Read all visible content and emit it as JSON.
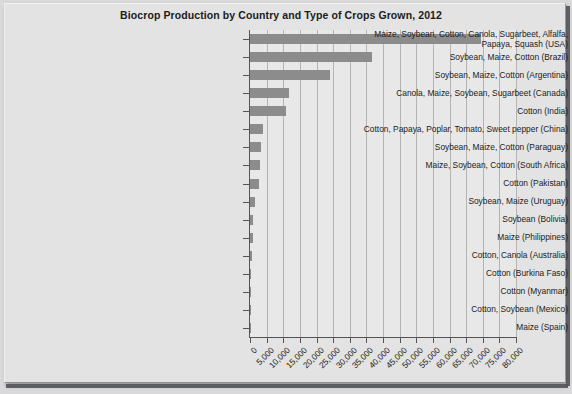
{
  "chart_data": {
    "type": "bar",
    "orientation": "horizontal",
    "title": "Biocrop Production by Country and Type of Crops Grown, 2012",
    "xlabel": "",
    "ylabel": "",
    "xlim": [
      0,
      80000
    ],
    "xticks": [
      "0",
      "5,000",
      "10,000",
      "15,000",
      "20,000",
      "25,000",
      "30,000",
      "35,000",
      "40,000",
      "45,000",
      "50,000",
      "55,000",
      "60,000",
      "65,000",
      "70,000",
      "75,000",
      "80,000"
    ],
    "grid": true,
    "legend": "none",
    "bar_color": "#8c8c8c",
    "plot_background": "#e8e8e8",
    "panel_background": "#e3e3e3",
    "categories": [
      "Maize, Soybean, Cotton, Canola, Sugarbeet, Alfalfa, Papaya, Squash (USA)",
      "Soybean, Maize, Cotton (Brazil)",
      "Soybean, Maize, Cotton (Argentina)",
      "Canola, Maize, Soybean, Sugarbeet (Canada)",
      "Cotton (India)",
      "Cotton, Papaya, Poplar, Tomato, Sweet pepper (China)",
      "Soybean, Maize, Cotton (Paraguay)",
      "Maize, Soybean, Cotton (South Africa)",
      "Cotton (Pakistan)",
      "Soybean, Maize (Uruguay)",
      "Soybean (Bolivia)",
      "Maize (Philippines)",
      "Cotton, Canola (Australia)",
      "Cotton (Burkina Faso)",
      "Cotton (Myanmar)",
      "Cotton, Soybean (Mexico)",
      "Maize (Spain)"
    ],
    "categories_display": [
      "Maize, Soybean, Cotton, Canola, Sugarbeet, Alfalfa,\nPapaya, Squash (USA)",
      "Soybean, Maize, Cotton (Brazil)",
      "Soybean, Maize, Cotton (Argentina)",
      "Canola, Maize, Soybean, Sugarbeet (Canada)",
      "Cotton (India)",
      "Cotton, Papaya, Poplar, Tomato, Sweet pepper (China)",
      "Soybean, Maize, Cotton (Paraguay)",
      "Maize, Soybean, Cotton (South Africa)",
      "Cotton (Pakistan)",
      "Soybean, Maize (Uruguay)",
      "Soybean (Bolivia)",
      "Maize (Philippines)",
      "Cotton, Canola (Australia)",
      "Cotton (Burkina Faso)",
      "Cotton (Myanmar)",
      "Cotton, Soybean (Mexico)",
      "Maize (Spain)"
    ],
    "values": [
      69500,
      36600,
      24000,
      11600,
      10800,
      4000,
      3400,
      2900,
      2800,
      1400,
      1000,
      800,
      700,
      300,
      300,
      200,
      100
    ]
  }
}
